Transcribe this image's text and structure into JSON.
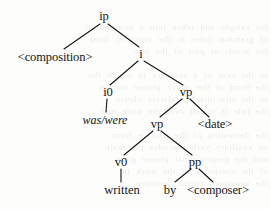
{
  "figure": {
    "kind": "syntax-tree",
    "ink_color": "#151515",
    "background_color": "#fdfdfc"
  },
  "nodes": [
    {
      "id": "ip",
      "label": "ip",
      "x": 104,
      "y": 16,
      "style": "plain"
    },
    {
      "id": "composition",
      "label": "<composition>",
      "x": 55,
      "y": 57,
      "style": "angle"
    },
    {
      "id": "i",
      "label": "i",
      "x": 141,
      "y": 54,
      "style": "plain"
    },
    {
      "id": "i0",
      "label": "i0",
      "x": 108,
      "y": 92,
      "style": "plain"
    },
    {
      "id": "vp-outer",
      "label": "vp",
      "x": 186,
      "y": 92,
      "style": "plain"
    },
    {
      "id": "was-were",
      "label": "was/were",
      "x": 105,
      "y": 120,
      "style": "italic"
    },
    {
      "id": "vp-inner",
      "label": "vp",
      "x": 157,
      "y": 124,
      "style": "plain"
    },
    {
      "id": "date",
      "label": "<date>",
      "x": 215,
      "y": 124,
      "style": "angle"
    },
    {
      "id": "v0",
      "label": "v0",
      "x": 121,
      "y": 162,
      "style": "plain"
    },
    {
      "id": "pp",
      "label": "pp",
      "x": 195,
      "y": 162,
      "style": "plain"
    },
    {
      "id": "written",
      "label": "written",
      "x": 122,
      "y": 190,
      "style": "terminal"
    },
    {
      "id": "by",
      "label": "by",
      "x": 170,
      "y": 190,
      "style": "terminal"
    },
    {
      "id": "composer",
      "label": "<composer>",
      "x": 218,
      "y": 190,
      "style": "angle"
    }
  ],
  "edges": [
    {
      "from": "ip",
      "to": "composition",
      "x1": 100,
      "y1": 24,
      "x2": 64,
      "y2": 49
    },
    {
      "from": "ip",
      "to": "i",
      "x1": 108,
      "y1": 24,
      "x2": 139,
      "y2": 47
    },
    {
      "from": "i",
      "to": "i0",
      "x1": 138,
      "y1": 61,
      "x2": 110,
      "y2": 85
    },
    {
      "from": "i",
      "to": "vp-outer",
      "x1": 144,
      "y1": 61,
      "x2": 183,
      "y2": 85
    },
    {
      "from": "i0",
      "to": "was-were",
      "x1": 107,
      "y1": 99,
      "x2": 106,
      "y2": 112
    },
    {
      "from": "vp-outer",
      "to": "vp-inner",
      "x1": 182,
      "y1": 99,
      "x2": 160,
      "y2": 117
    },
    {
      "from": "vp-outer",
      "to": "date",
      "x1": 190,
      "y1": 99,
      "x2": 209,
      "y2": 117
    },
    {
      "from": "vp-inner",
      "to": "v0",
      "x1": 153,
      "y1": 131,
      "x2": 124,
      "y2": 155
    },
    {
      "from": "vp-inner",
      "to": "pp",
      "x1": 161,
      "y1": 131,
      "x2": 192,
      "y2": 155
    },
    {
      "from": "v0",
      "to": "written",
      "x1": 121,
      "y1": 169,
      "x2": 121,
      "y2": 182
    },
    {
      "from": "pp",
      "to": "by",
      "x1": 191,
      "y1": 169,
      "x2": 175,
      "y2": 182
    },
    {
      "from": "pp",
      "to": "composer",
      "x1": 199,
      "y1": 169,
      "x2": 213,
      "y2": 182
    }
  ],
  "ghost_text": {
    "note": "faint show-through of printed text from the reverse side of the scanned page",
    "lines": [
      {
        "y": 22,
        "text": "the sample and taken into a new set of"
      },
      {
        "y": 34,
        "text": "of grammar rules to the syntactic form"
      },
      {
        "y": 46,
        "text": "the words as part of the tree"
      },
      {
        "y": 70,
        "text": "in the case of a sentence in which the"
      },
      {
        "y": 82,
        "text": "the form of the above phrase marker"
      },
      {
        "y": 94,
        "text": "in the structure of relative clause"
      },
      {
        "y": 106,
        "text": "the rule is stated over the node and"
      },
      {
        "y": 130,
        "text": "the derivation of the passive form"
      },
      {
        "y": 142,
        "text": "an auxiliary verb precedes the main"
      },
      {
        "y": 154,
        "text": "and the prepositional phrase gives"
      },
      {
        "y": 166,
        "text": "of the composer of the work in"
      },
      {
        "y": 178,
        "text": "the generated output sentence"
      }
    ]
  }
}
